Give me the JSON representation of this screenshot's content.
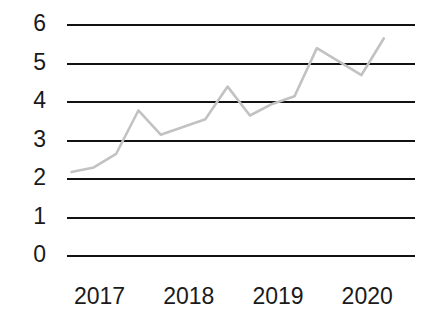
{
  "chart_data": {
    "type": "line",
    "title": "",
    "subtitle": "",
    "xlabel": "",
    "ylabel": "",
    "grid": true,
    "legend": null,
    "legend_position": "none",
    "annotations": [],
    "line_color": "#c2c2c2",
    "axis_color": "#121212",
    "text_color": "#1a1a1a",
    "background": "#ffffff",
    "ylim": [
      0,
      6
    ],
    "y_ticks": [
      0,
      1,
      2,
      3,
      4,
      5,
      6
    ],
    "y_tick_labels": [
      "0",
      "1",
      "2",
      "3",
      "4",
      "5",
      "6"
    ],
    "x_ticks": [
      2017,
      2018,
      2019,
      2020
    ],
    "x_tick_labels": [
      "2017",
      "2018",
      "2019",
      "2020"
    ],
    "xlim": [
      2016.9,
      2020.8
    ],
    "series": [
      {
        "name": "series-1",
        "x": [
          2016.95,
          2017.2,
          2017.45,
          2017.7,
          2017.95,
          2018.2,
          2018.45,
          2018.7,
          2018.95,
          2019.2,
          2019.45,
          2019.7,
          2019.95,
          2020.2,
          2020.45
        ],
        "values": [
          2.18,
          2.3,
          2.65,
          3.78,
          3.15,
          3.35,
          3.55,
          4.4,
          3.65,
          3.95,
          4.15,
          5.4,
          5.05,
          4.7,
          5.65
        ]
      }
    ]
  }
}
